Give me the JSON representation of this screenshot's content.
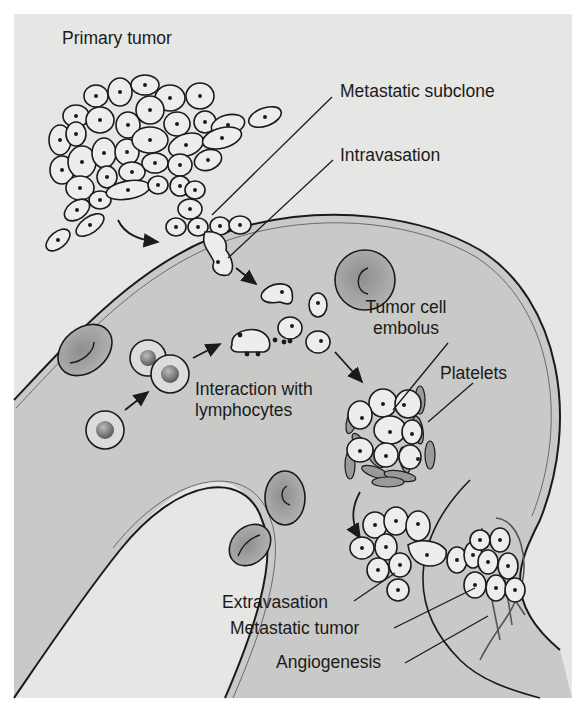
{
  "figure": {
    "labels": {
      "primary_tumor": "Primary tumor",
      "metastatic_subclone": "Metastatic subclone",
      "intravasation": "Intravasation",
      "tumor_cell_embolus_line1": "Tumor cell",
      "tumor_cell_embolus_line2": "embolus",
      "platelets": "Platelets",
      "interaction_line1": "Interaction with",
      "interaction_line2": "lymphocytes",
      "extravasation": "Extravasation",
      "metastatic_tumor": "Metastatic tumor",
      "angiogenesis": "Angiogenesis"
    },
    "colors": {
      "background": "#e6e6e4",
      "vessel_lumen": "#c9c9c7",
      "tumor_cell_fill": "#ededeb",
      "red_cell_fill": "#a9a9a7",
      "platelet_fill": "#9a9a98",
      "outline": "#1a1a1a"
    }
  }
}
